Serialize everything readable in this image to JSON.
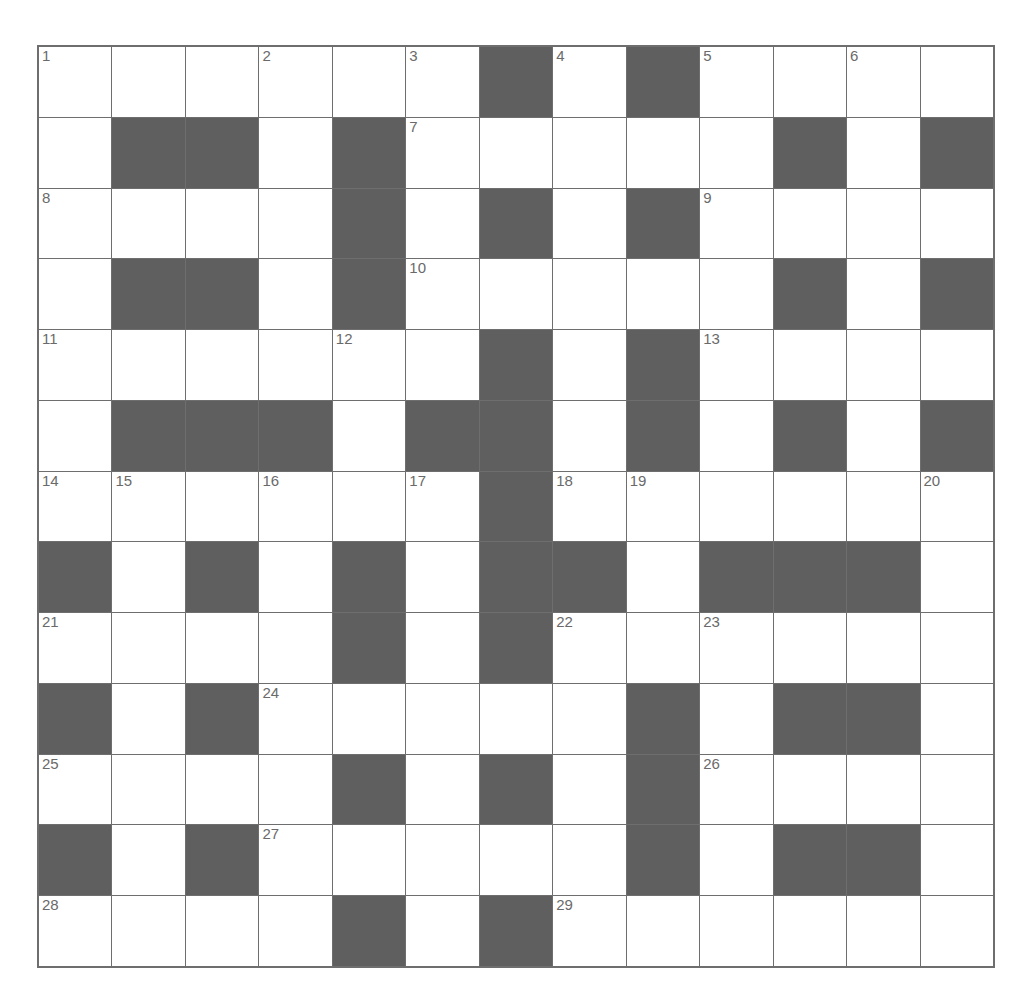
{
  "puzzle": {
    "rows": 13,
    "cols": 13,
    "colors": {
      "white": "#ffffff",
      "block": "#5f5f5f",
      "line": "#6e6e6e",
      "number": "#6a6a6a"
    },
    "layout": [
      "WWWWWWBWBWWWW",
      "WBBWBWWWWWBWB",
      "WWWWBWBWBWWWW",
      "WBBWBWWWWWBWB",
      "WWWWWWBWBWWWW",
      "WBBBWBBWBWBWB",
      "WWWWWWBWWWWWW",
      "BWBWBWBBWBBBW",
      "WWWWBWBWWWWWW",
      "BWBWWWWWBWBBW",
      "WWWWBWBWBWWWW",
      "BWBWWWWWBWBBW",
      "WWWWBWBWWWWWW"
    ],
    "numbers": [
      {
        "r": 0,
        "c": 0,
        "n": "1"
      },
      {
        "r": 0,
        "c": 3,
        "n": "2"
      },
      {
        "r": 0,
        "c": 5,
        "n": "3"
      },
      {
        "r": 0,
        "c": 7,
        "n": "4"
      },
      {
        "r": 0,
        "c": 9,
        "n": "5"
      },
      {
        "r": 0,
        "c": 11,
        "n": "6"
      },
      {
        "r": 1,
        "c": 5,
        "n": "7"
      },
      {
        "r": 2,
        "c": 0,
        "n": "8"
      },
      {
        "r": 2,
        "c": 9,
        "n": "9"
      },
      {
        "r": 3,
        "c": 5,
        "n": "10"
      },
      {
        "r": 4,
        "c": 0,
        "n": "11"
      },
      {
        "r": 4,
        "c": 4,
        "n": "12"
      },
      {
        "r": 4,
        "c": 9,
        "n": "13"
      },
      {
        "r": 6,
        "c": 0,
        "n": "14"
      },
      {
        "r": 6,
        "c": 1,
        "n": "15"
      },
      {
        "r": 6,
        "c": 3,
        "n": "16"
      },
      {
        "r": 6,
        "c": 5,
        "n": "17"
      },
      {
        "r": 6,
        "c": 7,
        "n": "18"
      },
      {
        "r": 6,
        "c": 8,
        "n": "19"
      },
      {
        "r": 6,
        "c": 12,
        "n": "20"
      },
      {
        "r": 8,
        "c": 0,
        "n": "21"
      },
      {
        "r": 8,
        "c": 7,
        "n": "22"
      },
      {
        "r": 8,
        "c": 9,
        "n": "23"
      },
      {
        "r": 9,
        "c": 3,
        "n": "24"
      },
      {
        "r": 10,
        "c": 0,
        "n": "25"
      },
      {
        "r": 10,
        "c": 9,
        "n": "26"
      },
      {
        "r": 11,
        "c": 3,
        "n": "27"
      },
      {
        "r": 12,
        "c": 0,
        "n": "28"
      },
      {
        "r": 12,
        "c": 7,
        "n": "29"
      }
    ]
  }
}
